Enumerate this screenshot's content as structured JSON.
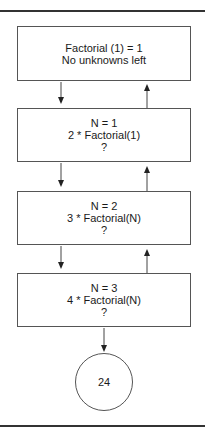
{
  "diagram": {
    "boxes": [
      {
        "lines": [
          "Factorial (1) = 1",
          "No unknowns left"
        ]
      },
      {
        "lines": [
          "N = 1",
          "2 * Factorial(1)",
          "?"
        ]
      },
      {
        "lines": [
          "N = 2",
          "3 * Factorial(N)",
          "?"
        ]
      },
      {
        "lines": [
          "N = 3",
          "4 * Factorial(N)",
          "?"
        ]
      }
    ],
    "result": "24"
  }
}
